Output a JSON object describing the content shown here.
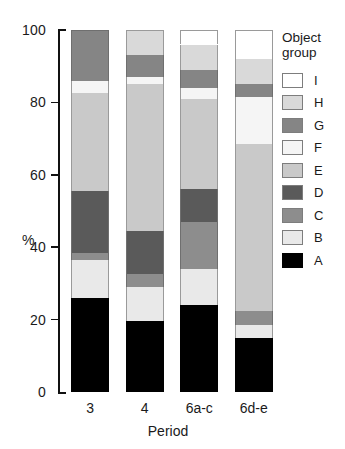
{
  "chart_data": {
    "type": "bar",
    "subtype": "stacked-bar-100",
    "title": "",
    "xlabel": "Period",
    "ylabel": "%",
    "ylim": [
      0,
      100
    ],
    "yticks": [
      0,
      20,
      40,
      60,
      80,
      100
    ],
    "ytick_labels": [
      "0",
      "20",
      "40",
      "60",
      "80",
      "100"
    ],
    "grid": false,
    "legend_title": "Object group",
    "legend_position": "right",
    "categories": [
      "3",
      "4",
      "6a-c",
      "6d-e"
    ],
    "series": [
      {
        "name": "A",
        "color": "#000000",
        "values": [
          26,
          19.5,
          24,
          15
        ]
      },
      {
        "name": "B",
        "color": "#e9e9e9",
        "values": [
          10.5,
          9.5,
          10,
          3.5
        ]
      },
      {
        "name": "C",
        "color": "#8d8d8d",
        "values": [
          2,
          3.5,
          13,
          4
        ]
      },
      {
        "name": "D",
        "color": "#5a5a5a",
        "values": [
          17,
          12,
          9,
          0
        ]
      },
      {
        "name": "E",
        "color": "#c9c9c9",
        "values": [
          27,
          40.5,
          25,
          46
        ]
      },
      {
        "name": "F",
        "color": "#f5f5f5",
        "values": [
          3.5,
          2,
          3,
          13
        ]
      },
      {
        "name": "G",
        "color": "#858585",
        "values": [
          14,
          6,
          5,
          3.5
        ]
      },
      {
        "name": "H",
        "color": "#d9d9d9",
        "values": [
          0,
          7,
          7,
          7
        ]
      },
      {
        "name": "I",
        "color": "#ffffff",
        "values": [
          0,
          0,
          4,
          8
        ]
      }
    ],
    "legend_entries": [
      {
        "label": "I",
        "color": "#ffffff"
      },
      {
        "label": "H",
        "color": "#d9d9d9"
      },
      {
        "label": "G",
        "color": "#858585"
      },
      {
        "label": "F",
        "color": "#f5f5f5"
      },
      {
        "label": "E",
        "color": "#c9c9c9"
      },
      {
        "label": "D",
        "color": "#5a5a5a"
      },
      {
        "label": "C",
        "color": "#8d8d8d"
      },
      {
        "label": "B",
        "color": "#e9e9e9"
      },
      {
        "label": "A",
        "color": "#000000"
      }
    ],
    "legend_title_lines": [
      "Object",
      "group"
    ]
  }
}
